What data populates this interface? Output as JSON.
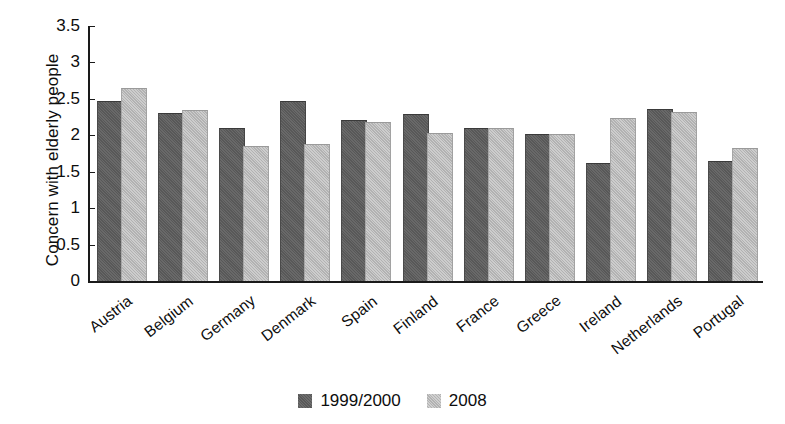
{
  "chart_data": {
    "type": "bar",
    "title": "",
    "xlabel": "",
    "ylabel": "Concern with elderly people",
    "ylim": [
      0,
      3.5
    ],
    "ytick_labels": [
      "3.5",
      "3",
      "2.5",
      "2",
      "1.5",
      "1",
      "0.5",
      "0"
    ],
    "ytick_values": [
      3.5,
      3,
      2.5,
      2,
      1.5,
      1,
      0.5,
      0
    ],
    "grid": false,
    "legend_position": "bottom-center",
    "categories": [
      "Austria",
      "Belgium",
      "Germany",
      "Denmark",
      "Spain",
      "Finland",
      "France",
      "Greece",
      "Ireland",
      "Netherlands",
      "Portugal"
    ],
    "series": [
      {
        "name": "1999/2000",
        "color": "#585858",
        "values": [
          2.46,
          2.29,
          2.09,
          2.46,
          2.19,
          2.28,
          2.09,
          2.0,
          1.6,
          2.35,
          1.63
        ]
      },
      {
        "name": "2008",
        "color": "#b2b2b2",
        "values": [
          2.64,
          2.33,
          1.84,
          1.87,
          2.17,
          2.02,
          2.09,
          2.01,
          2.22,
          2.3,
          1.81
        ]
      }
    ]
  },
  "axis": {
    "y_title": "Concern with elderly people"
  },
  "legend": {
    "items": [
      {
        "label": "1999/2000"
      },
      {
        "label": "2008"
      }
    ]
  }
}
